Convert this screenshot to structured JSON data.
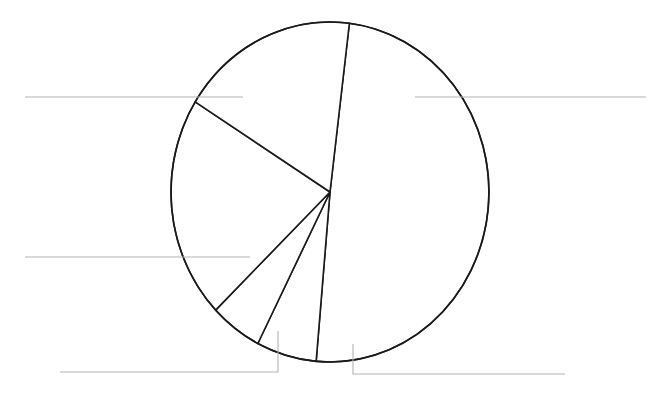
{
  "canvas": {
    "width": 658,
    "height": 400,
    "background_color": "#ffffff"
  },
  "figure": {
    "title": "",
    "subtitle": "",
    "has_visible_title": false,
    "has_visible_legend": false,
    "has_visible_labels": false,
    "note": "unlabeled pie chart with blank leader lines"
  },
  "style": {
    "slice_fill": "#ffffff",
    "slice_stroke": "#1a1a1a",
    "slice_stroke_width": 1.6,
    "leader_stroke": "#b3b3b3",
    "leader_stroke_width": 1.1,
    "label_color": "#222222"
  },
  "geometry": {
    "center_x": 330,
    "center_y": 192,
    "radius_x": 159,
    "radius_y": 170,
    "start_angle_deg": 7
  },
  "chart_data": {
    "type": "pie",
    "title": "",
    "subtitle": "",
    "xlabel": "",
    "ylabel": "",
    "grid": false,
    "legend": false,
    "legend_position": "none",
    "start_angle_deg": 7,
    "direction": "clockwise",
    "labels": [
      "",
      "",
      "",
      "",
      ""
    ],
    "values": [
      49.4,
      6.2,
      5.3,
      21.1,
      18.0
    ],
    "percentages": [
      "49.4%",
      "6.2%",
      "5.3%",
      "21.1%",
      "18.0%"
    ],
    "slice_boundaries_deg": [
      7,
      185,
      208,
      284,
      360
    ],
    "slices": [
      {
        "label": "",
        "value": 49.4,
        "percent": "49.4%",
        "start_deg": 7,
        "end_deg": 185,
        "leader": "right-upper"
      },
      {
        "label": "",
        "value": 6.2,
        "percent": "6.2%",
        "start_deg": 185,
        "end_deg": 207,
        "leader": "bottom-right-elbow"
      },
      {
        "label": "",
        "value": 5.3,
        "percent": "5.3%",
        "start_deg": 207,
        "end_deg": 226,
        "leader": "bottom-left-elbow"
      },
      {
        "label": "",
        "value": 21.1,
        "percent": "21.1%",
        "start_deg": 226,
        "end_deg": 302,
        "leader": "left-lower"
      },
      {
        "label": "",
        "value": 18.0,
        "percent": "18.0%",
        "start_deg": 302,
        "end_deg": 367,
        "leader": "left-upper"
      }
    ],
    "annotations": []
  },
  "leaders": [
    {
      "name": "left-upper-leader",
      "text": "",
      "path": "M 25 97 L 243 97",
      "anchor_x": 25,
      "anchor_y": 97
    },
    {
      "name": "left-lower-leader",
      "text": "",
      "path": "M 25 257 L 250 257",
      "anchor_x": 25,
      "anchor_y": 257
    },
    {
      "name": "right-upper-leader",
      "text": "",
      "path": "M 415 97 L 646 97",
      "anchor_x": 646,
      "anchor_y": 97
    },
    {
      "name": "bottom-left-leader",
      "text": "",
      "path": "M 278 331 L 278 372 L 60 372",
      "anchor_x": 60,
      "anchor_y": 372
    },
    {
      "name": "bottom-right-leader",
      "text": "",
      "path": "M 353 344 L 353 374 L 565 374",
      "anchor_x": 565,
      "anchor_y": 374
    }
  ]
}
